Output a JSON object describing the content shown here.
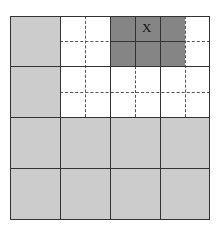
{
  "diagram": {
    "colors": {
      "light_gray": "#cccccc",
      "dark_gray": "#858585",
      "white": "#ffffff",
      "line": "#333333"
    },
    "marker_label": "X"
  }
}
